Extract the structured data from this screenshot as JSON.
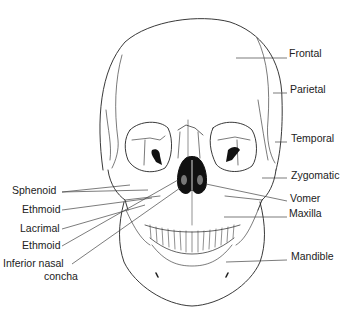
{
  "diagram": {
    "colors": {
      "line": "#222222",
      "fill": "#ffffff",
      "dark": "#111111",
      "label": "#222222"
    },
    "labels_left": [
      {
        "text": "Sphenoid",
        "x": 12,
        "y": 190
      },
      {
        "text": "Ethmoid",
        "x": 22,
        "y": 209
      },
      {
        "text": "Lacrimal",
        "x": 20,
        "y": 228
      },
      {
        "text": "Ethmoid",
        "x": 22,
        "y": 245
      },
      {
        "text": "Inferior nasal",
        "x": 3,
        "y": 263
      },
      {
        "text": "concha",
        "x": 44,
        "y": 276
      }
    ],
    "labels_right": [
      {
        "text": "Frontal",
        "x": 289,
        "y": 53
      },
      {
        "text": "Parietal",
        "x": 290,
        "y": 89
      },
      {
        "text": "Temporal",
        "x": 291,
        "y": 138
      },
      {
        "text": "Zygomatic",
        "x": 291,
        "y": 175
      },
      {
        "text": "Vomer",
        "x": 290,
        "y": 198
      },
      {
        "text": "Maxilla",
        "x": 289,
        "y": 213
      },
      {
        "text": "Mandible",
        "x": 291,
        "y": 256
      }
    ]
  }
}
